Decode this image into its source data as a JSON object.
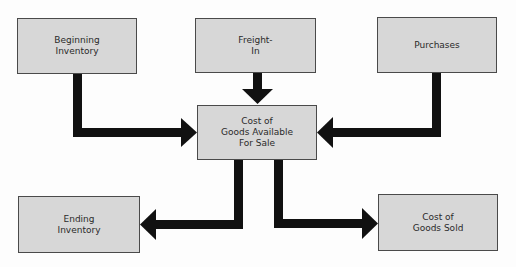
{
  "diagram": {
    "nodes": {
      "beginning_inventory": "Beginning\nInventory",
      "freight_in": "Freight-\nIn",
      "purchases": "Purchases",
      "cogs_available": "Cost of\nGoods Available\nFor Sale",
      "ending_inventory": "Ending\nInventory",
      "cogs_sold": "Cost of\nGoods Sold"
    },
    "edges": [
      {
        "from": "Beginning Inventory",
        "to": "Cost of Goods Available For Sale"
      },
      {
        "from": "Freight-In",
        "to": "Cost of Goods Available For Sale"
      },
      {
        "from": "Purchases",
        "to": "Cost of Goods Available For Sale"
      },
      {
        "from": "Cost of Goods Available For Sale",
        "to": "Ending Inventory"
      },
      {
        "from": "Cost of Goods Available For Sale",
        "to": "Cost of Goods Sold"
      }
    ],
    "colors": {
      "box_fill": "#d7d7d7",
      "box_border": "#4a4a4a",
      "arrow": "#111111"
    }
  }
}
